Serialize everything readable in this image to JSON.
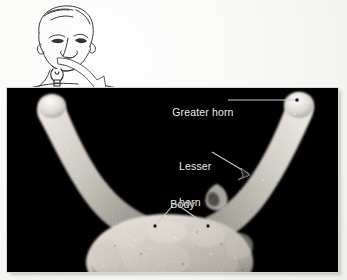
{
  "figure": {
    "background_color": "#f4f4f2",
    "panel_color": "#000000",
    "label_color": "#ededed",
    "bone_color": "#d9d6cf"
  },
  "inset": {
    "name": "head-neck-line-drawing",
    "description": "Line drawing of a head tilted back showing the neck",
    "hyoid_marker": "hyoid-bone-symbol",
    "arrow": "curved-pointer-arrow"
  },
  "labels": [
    {
      "id": "greater-horn",
      "text": "Greater horn",
      "lines": [
        "Greater horn"
      ],
      "leader": "horizontal-line-to-right-horn-tip",
      "target_marker": "dot"
    },
    {
      "id": "lesser-horn",
      "text": "Lesser horn",
      "lines": [
        "Lesser",
        "horn"
      ],
      "leader": "diagonal-line-to-lesser-horn",
      "target_marker": "arrowhead"
    },
    {
      "id": "body",
      "text": "Body",
      "lines": [
        "Body"
      ],
      "leader": "two-branch-v-lines-to-body",
      "target_marker": "dot"
    }
  ],
  "specimen": {
    "name": "hyoid-bone-photograph",
    "view": "superior-anterior",
    "parts": [
      "left greater horn",
      "right greater horn",
      "lesser horn",
      "body"
    ]
  }
}
